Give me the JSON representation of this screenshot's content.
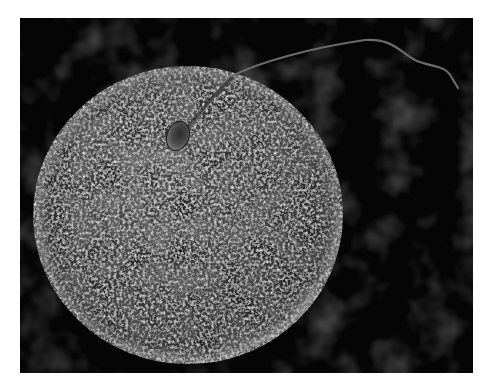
{
  "image": {
    "description": "Scanning electron micrograph-style image of a single sperm cell attaching to the textured surface of a large spherical egg cell (ovum) against a dark background",
    "subjects": [
      {
        "name": "egg-cell",
        "shape": "sphere",
        "texture": "rough fibrous surface",
        "tone": "grey"
      },
      {
        "name": "sperm-cell",
        "parts": [
          "head",
          "midpiece",
          "tail"
        ],
        "position": "upper center of egg, tail extending to upper right"
      }
    ],
    "colors": {
      "page_background": "#ffffff",
      "image_background": "#050505",
      "background_haze": "#2a2a2a",
      "egg_light": "#9a9a9a",
      "egg_mid": "#5e5e5e",
      "egg_dark": "#2e2e2e",
      "sperm_head": "#4a4a4a",
      "sperm_tail": "#6a6a6a"
    }
  }
}
